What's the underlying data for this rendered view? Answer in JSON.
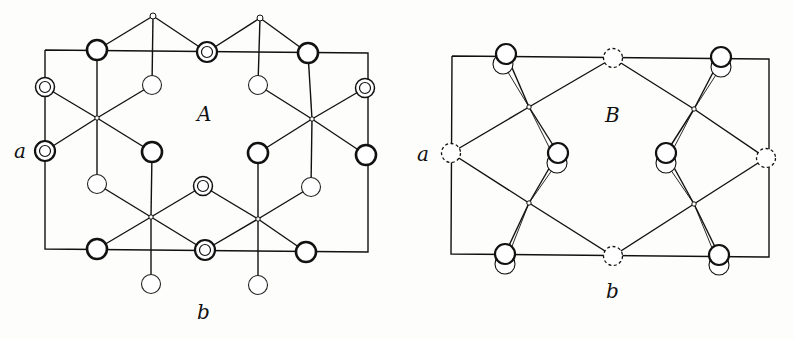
{
  "figure": {
    "panels": [
      {
        "id": "A",
        "label": "A",
        "axis_a_label": "a",
        "axis_b_label": "b",
        "atom_types": [
          "thick-circle",
          "double-circle",
          "thin-circle",
          "small-dot"
        ]
      },
      {
        "id": "B",
        "label": "B",
        "axis_a_label": "a",
        "axis_b_label": "b",
        "atom_types": [
          "paired-circle",
          "dashed-circle",
          "small-dot"
        ]
      }
    ]
  }
}
